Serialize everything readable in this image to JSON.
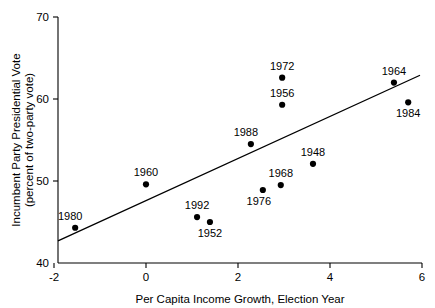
{
  "chart_data": {
    "type": "scatter",
    "title": "",
    "xlabel": "Per Capita Income Growth, Election Year",
    "ylabel_line1": "Incumbent Party Presidential Vote",
    "ylabel_line2": "(percent of two-party vote)",
    "xlim": [
      -2,
      6
    ],
    "ylim": [
      40,
      70
    ],
    "xticks": [
      -2,
      0,
      2,
      4,
      6
    ],
    "xtick_labels": [
      "-2",
      "0",
      "2",
      "4",
      "6"
    ],
    "yticks": [
      40,
      50,
      60,
      70
    ],
    "ytick_labels": [
      "40",
      "50",
      "60",
      "70"
    ],
    "grid": false,
    "legend": "none",
    "marker_color": "#000000",
    "line_color": "#000000",
    "points": [
      {
        "label": "1980",
        "x": -1.54,
        "y": 44.3,
        "label_pos": "above-left"
      },
      {
        "label": "1960",
        "x": 0.0,
        "y": 49.6,
        "label_pos": "above"
      },
      {
        "label": "1992",
        "x": 1.11,
        "y": 45.6,
        "label_pos": "above"
      },
      {
        "label": "1952",
        "x": 1.39,
        "y": 45.0,
        "label_pos": "below"
      },
      {
        "label": "1988",
        "x": 2.28,
        "y": 54.5,
        "label_pos": "above-left"
      },
      {
        "label": "1976",
        "x": 2.54,
        "y": 48.9,
        "label_pos": "below-left"
      },
      {
        "label": "1968",
        "x": 2.93,
        "y": 49.5,
        "label_pos": "above"
      },
      {
        "label": "1956",
        "x": 2.96,
        "y": 59.3,
        "label_pos": "above"
      },
      {
        "label": "1972",
        "x": 2.96,
        "y": 62.6,
        "label_pos": "above"
      },
      {
        "label": "1948",
        "x": 3.63,
        "y": 52.1,
        "label_pos": "above"
      },
      {
        "label": "1964",
        "x": 5.39,
        "y": 62.0,
        "label_pos": "above"
      },
      {
        "label": "1984",
        "x": 5.7,
        "y": 59.6,
        "label_pos": "below"
      }
    ],
    "fit_line": {
      "x1": -2.0,
      "y1": 42.7,
      "x2": 6.0,
      "y2": 62.9
    }
  }
}
